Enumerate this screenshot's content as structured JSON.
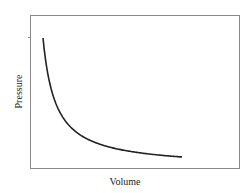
{
  "chart_data": {
    "type": "line",
    "title": "",
    "xlabel": "Volume",
    "ylabel": "Pressure",
    "grid": false,
    "legend": null,
    "x": [
      1,
      1.5,
      2,
      3,
      4,
      5,
      6,
      8,
      10,
      12
    ],
    "series": [
      {
        "name": "Pressure vs Volume",
        "values": [
          10,
          6.67,
          5,
          3.33,
          2.5,
          2,
          1.67,
          1.25,
          1,
          0.83
        ]
      }
    ],
    "xlim": [
      0.3,
      14
    ],
    "ylim": [
      0,
      11.5
    ],
    "colors": {
      "line": "#222222",
      "frame": "#888888"
    }
  }
}
